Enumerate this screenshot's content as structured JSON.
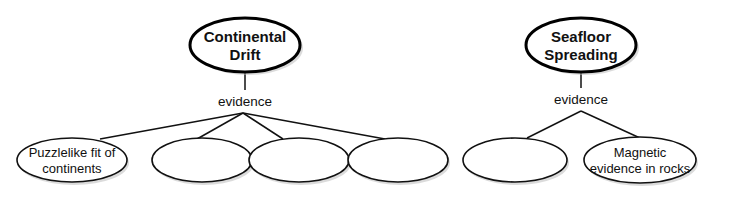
{
  "concept_maps": [
    {
      "main_concept": {
        "line1": "Continental",
        "line2": "Drift"
      },
      "link_label": "evidence",
      "children": [
        {
          "line1": "Puzzlelike fit of",
          "line2": "continents"
        },
        {
          "line1": "",
          "line2": ""
        },
        {
          "line1": "",
          "line2": ""
        },
        {
          "line1": "",
          "line2": ""
        }
      ]
    },
    {
      "main_concept": {
        "line1": "Seafloor",
        "line2": "Spreading"
      },
      "link_label": "evidence",
      "children": [
        {
          "line1": "",
          "line2": ""
        },
        {
          "line1": "Magnetic",
          "line2": "evidence in rocks"
        }
      ]
    }
  ],
  "colors": {
    "stroke": "#111111",
    "fill": "#ffffff",
    "shadow": "#bdbdbd"
  }
}
